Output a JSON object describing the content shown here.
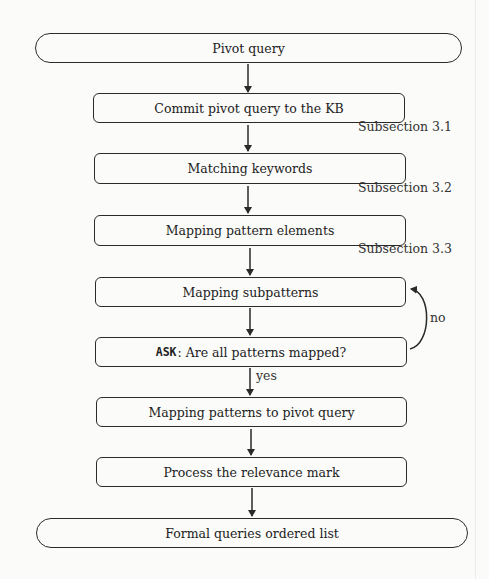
{
  "diagram": {
    "type": "flowchart",
    "nodes": [
      {
        "id": "start",
        "shape": "terminal",
        "label": "Pivot query"
      },
      {
        "id": "commit",
        "shape": "process",
        "label": "Commit pivot query to the KB",
        "annotation": "Subsection 3.1"
      },
      {
        "id": "keywords",
        "shape": "process",
        "label": "Matching keywords",
        "annotation": "Subsection 3.2"
      },
      {
        "id": "elements",
        "shape": "process",
        "label": "Mapping pattern elements",
        "annotation": "Subsection 3.3"
      },
      {
        "id": "subpatterns",
        "shape": "process",
        "label": "Mapping subpatterns"
      },
      {
        "id": "ask",
        "shape": "decision-box",
        "keyword": "ASK",
        "label": ": Are all patterns mapped?"
      },
      {
        "id": "topivot",
        "shape": "process",
        "label": "Mapping patterns to pivot query"
      },
      {
        "id": "relevance",
        "shape": "process",
        "label": "Process the relevance mark"
      },
      {
        "id": "end",
        "shape": "terminal",
        "label": "Formal queries ordered list"
      }
    ],
    "edges": [
      {
        "from": "start",
        "to": "commit",
        "label": ""
      },
      {
        "from": "commit",
        "to": "keywords",
        "label": ""
      },
      {
        "from": "keywords",
        "to": "elements",
        "label": ""
      },
      {
        "from": "elements",
        "to": "subpatterns",
        "label": ""
      },
      {
        "from": "subpatterns",
        "to": "ask",
        "label": ""
      },
      {
        "from": "ask",
        "to": "subpatterns",
        "label": "no"
      },
      {
        "from": "ask",
        "to": "topivot",
        "label": "yes"
      },
      {
        "from": "topivot",
        "to": "relevance",
        "label": ""
      },
      {
        "from": "relevance",
        "to": "end",
        "label": ""
      }
    ],
    "edge_labels": {
      "no": "no",
      "yes": "yes"
    },
    "colors": {
      "stroke": "#2a2a2a",
      "background": "#fbfbf9",
      "text": "#222222"
    }
  }
}
